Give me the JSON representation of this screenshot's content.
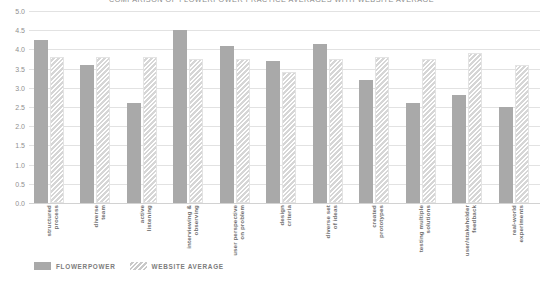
{
  "chart_data": {
    "type": "bar",
    "title": "COMPARISON OF FLOWERPOWER PRACTICE AVERAGES WITH WEBSITE AVERAGE",
    "xlabel": "",
    "ylabel": "",
    "ylim": [
      0.0,
      5.0
    ],
    "ytick_labels": [
      "5.0",
      "4.5",
      "4.0",
      "3.5",
      "3.0",
      "2.5",
      "2.0",
      "1.5",
      "1.0",
      "0.5",
      "0.0"
    ],
    "ytick_values": [
      5.0,
      4.5,
      4.0,
      3.5,
      3.0,
      2.5,
      2.0,
      1.5,
      1.0,
      0.5,
      0.0
    ],
    "grid": true,
    "legend_position": "bottom-left",
    "categories": [
      "structured process",
      "diverse team",
      "active listening",
      "interviewing & observing",
      "user perspective on problem",
      "design criteria",
      "diverse set of ideas",
      "created prototypes",
      "testing multiple solutions",
      "user/stakeholder feedback",
      "real-world experiments"
    ],
    "series": [
      {
        "name": "FLOWERPOWER",
        "color": "#a9a9a9",
        "style": "solid",
        "values": [
          4.25,
          3.6,
          2.6,
          4.5,
          4.1,
          3.7,
          4.15,
          3.2,
          2.6,
          2.8,
          2.5
        ]
      },
      {
        "name": "WEBSITE AVERAGE",
        "color": "#d6d6d6",
        "style": "diagonal-hatch",
        "values": [
          3.8,
          3.8,
          3.8,
          3.75,
          3.75,
          3.4,
          3.75,
          3.8,
          3.75,
          3.9,
          3.6
        ]
      }
    ]
  },
  "legend": {
    "items": [
      {
        "label": "FLOWERPOWER",
        "swatch": "solid-gray-swatch"
      },
      {
        "label": "WEBSITE AVERAGE",
        "swatch": "hatched-swatch"
      }
    ]
  }
}
